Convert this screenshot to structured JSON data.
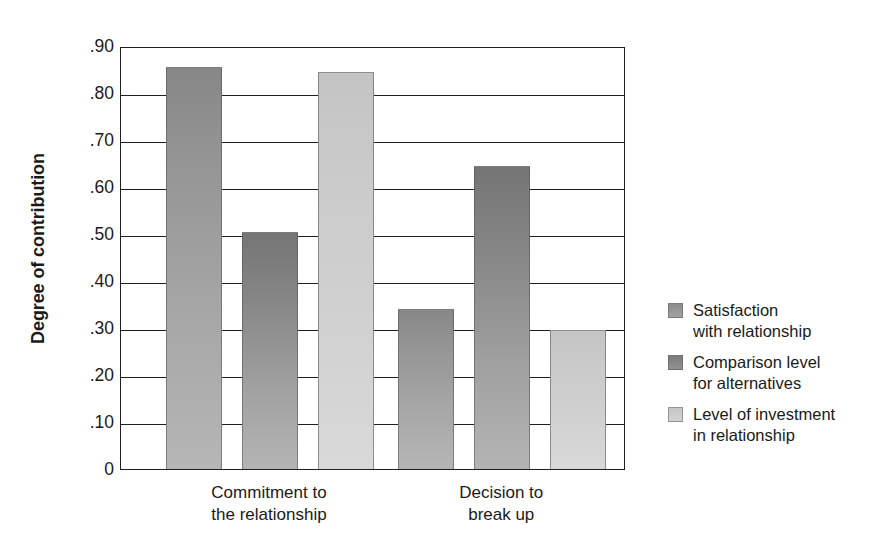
{
  "chart_data": {
    "type": "bar",
    "title": "",
    "subtitle": "",
    "xlabel": "",
    "ylabel": "Degree of contribution",
    "ylim": [
      0,
      0.9
    ],
    "ytick_labels": [
      "0",
      ".10",
      ".20",
      ".30",
      ".40",
      ".50",
      ".60",
      ".70",
      ".80",
      ".90"
    ],
    "ytick_values": [
      0,
      0.1,
      0.2,
      0.3,
      0.4,
      0.5,
      0.6,
      0.7,
      0.8,
      0.9
    ],
    "grid": "horizontal",
    "legend_position": "right",
    "categories": [
      "Commitment to\nthe relationship",
      "Decision to\nbreak up"
    ],
    "series": [
      {
        "name": "Satisfaction\nwith relationship",
        "color": "#8d8d8d",
        "values": [
          0.855,
          0.34
        ]
      },
      {
        "name": "Comparison level\nfor alternatives",
        "color": "#7c7c7c",
        "values": [
          0.505,
          0.645
        ]
      },
      {
        "name": "Level of investment\nin relationship",
        "color": "#c9c9c9",
        "values": [
          0.845,
          0.295
        ]
      }
    ]
  },
  "axis": {
    "y_title": "Degree of contribution"
  },
  "legend": {
    "entries": [
      {
        "label": "Satisfaction\nwith relationship"
      },
      {
        "label": "Comparison level\nfor alternatives"
      },
      {
        "label": "Level of investment\nin relationship"
      }
    ]
  },
  "colors": {
    "axis": "#1f1f1f",
    "text": "#1a1a1a",
    "background": "#ffffff",
    "series_1": "#8d8d8d",
    "series_2": "#7c7c7c",
    "series_3": "#c9c9c9"
  }
}
